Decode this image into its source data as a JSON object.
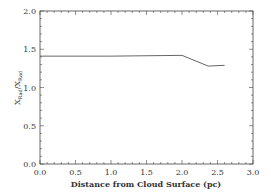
{
  "chart_data": {
    "type": "line",
    "title": "",
    "xlabel": "Distance from Cloud Surface (pc)",
    "ylabel": "X_Rad/X_Rad",
    "ylabel_main": "X",
    "ylabel_sub1": "Rad",
    "ylabel_sub2": "Rad",
    "xlim": [
      0.0,
      3.0
    ],
    "ylim": [
      0.0,
      2.0
    ],
    "xticks": [
      "0.0",
      "0.5",
      "1.0",
      "1.5",
      "2.0",
      "2.5",
      "3.0"
    ],
    "yticks": [
      "0.0",
      "0.5",
      "1.0",
      "1.5",
      "2.0"
    ],
    "grid": false,
    "legend": null,
    "series": [
      {
        "name": "ratio",
        "x": [
          0.0,
          1.0,
          2.0,
          2.37,
          2.6
        ],
        "y": [
          1.41,
          1.41,
          1.42,
          1.28,
          1.29
        ]
      }
    ]
  }
}
